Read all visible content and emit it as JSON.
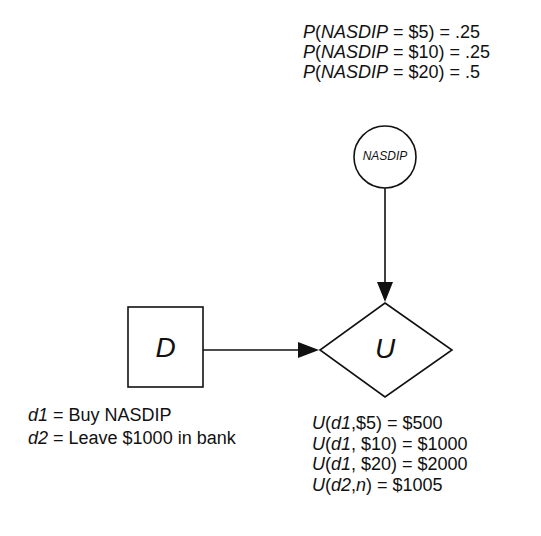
{
  "diagram": {
    "type": "influence-diagram",
    "nodes": [
      {
        "id": "D",
        "shape": "square",
        "label": "D",
        "role": "decision"
      },
      {
        "id": "NASDIP",
        "shape": "circle",
        "label": "NASDIP",
        "role": "chance"
      },
      {
        "id": "U",
        "shape": "diamond",
        "label": "U",
        "role": "utility"
      }
    ],
    "edges": [
      {
        "from": "NASDIP",
        "to": "U"
      },
      {
        "from": "D",
        "to": "U"
      }
    ]
  },
  "probabilities": {
    "lines": [
      {
        "fn": "P",
        "open": "(",
        "var": "NASDIP",
        "rest": " = $5) = .25"
      },
      {
        "fn": "P",
        "open": "(",
        "var": "NASDIP",
        "rest": " = $10) = .25"
      },
      {
        "fn": "P",
        "open": "(",
        "var": "NASDIP",
        "rest": " = $20) = .5"
      }
    ]
  },
  "decisions": {
    "lines": [
      {
        "var": "d1",
        "rest": " = Buy NASDIP"
      },
      {
        "var": "d2",
        "rest": " = Leave $1000 in bank"
      }
    ]
  },
  "utilities": {
    "lines": [
      {
        "fn": "U",
        "open": "(",
        "var": "d1",
        "mid": ",$5) = $500",
        "var2": "",
        "rest": ""
      },
      {
        "fn": "U",
        "open": "(",
        "var": "d1",
        "mid": ", $10) = $1000",
        "var2": "",
        "rest": ""
      },
      {
        "fn": "U",
        "open": "(",
        "var": "d1",
        "mid": ", $20) = $2000",
        "var2": "",
        "rest": ""
      },
      {
        "fn": "U",
        "open": "(",
        "var": "d2",
        "mid": ",",
        "var2": "n",
        "rest": ") = $1005"
      }
    ]
  },
  "colors": {
    "stroke": "#111111",
    "background": "#ffffff"
  }
}
